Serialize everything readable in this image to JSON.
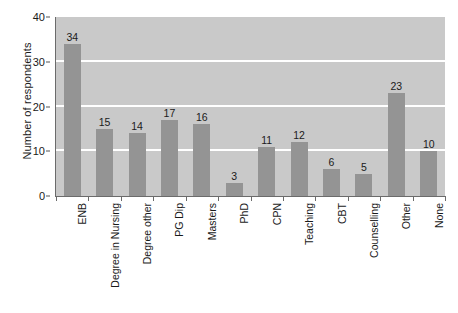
{
  "chart_data": {
    "type": "bar",
    "title": "",
    "xlabel": "",
    "ylabel": "Number of respondents",
    "ylim": [
      0,
      40
    ],
    "yticks": [
      0,
      10,
      20,
      30,
      40
    ],
    "gridlines": [
      10,
      20,
      30
    ],
    "grid": true,
    "legend": null,
    "orientation": "vertical",
    "categories": [
      "ENB",
      "Degree in Nursing",
      "Degree other",
      "PG Dip",
      "Masters",
      "PhD",
      "CPN",
      "Teaching",
      "CBT",
      "Counselling",
      "Other",
      "None"
    ],
    "values": [
      34,
      15,
      14,
      17,
      16,
      3,
      11,
      12,
      6,
      5,
      23,
      10
    ],
    "colors": {
      "bar": "#949494",
      "plot_background": "#c9c9c9",
      "gridline": "#ffffff",
      "axis": "#6b6b6b",
      "text": "#1a1a1a",
      "figure_background": "#ffffff"
    }
  },
  "caption": {
    "text": ""
  }
}
